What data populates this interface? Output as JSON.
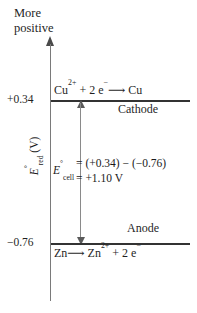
{
  "chart_data": {
    "type": "diagram",
    "ylabel": "E°red (V)",
    "axis_direction_note": "More positive",
    "levels": [
      {
        "name": "cathode",
        "value": 0.34,
        "tick_label": "+0.34",
        "equation": "Cu2+ + 2 e- ⟶ Cu",
        "electrode_label": "Cathode"
      },
      {
        "name": "anode",
        "value": -0.76,
        "tick_label": "−0.76",
        "equation": "Zn ⟶ Zn2+ + 2 e-",
        "electrode_label": "Anode"
      }
    ],
    "cell_potential": {
      "symbol": "E°cell",
      "expression": "= (+0.34) − (−0.76)",
      "result": "= +1.10 V",
      "value": 1.1,
      "unit": "V"
    },
    "ylim": [
      -0.76,
      0.34
    ],
    "grid": false,
    "legend": false
  },
  "axis": {
    "direction_line_1": "More",
    "direction_line_2": "positive",
    "title_symbol": "E",
    "title_superscript": "°",
    "title_subscript": "red",
    "title_unit": "(V)",
    "tick_top": "+0.34",
    "tick_bottom": "−0.76"
  },
  "cathode": {
    "species_left": "Cu",
    "species_left_charge": "2+",
    "plus": "+",
    "electrons": "2 e",
    "electron_charge": "−",
    "arrow": "⟶",
    "species_right": "Cu",
    "electrode_label": "Cathode"
  },
  "anode": {
    "species_left": "Zn",
    "arrow": "⟶",
    "species_right": "Zn",
    "species_right_charge": "2+",
    "plus": "+",
    "electrons": "2 e",
    "electron_charge": "−",
    "electrode_label": "Anode"
  },
  "cell": {
    "symbol_main": "E",
    "symbol_superscript": "°",
    "symbol_subscript": "cell",
    "line_1": "= (+0.34) − (−0.76)",
    "line_2": "= +1.10 V"
  },
  "colors": {
    "background": "#ffffff",
    "text": "#1f1f1f",
    "level_line": "#333333",
    "axis_line": "#7a7a7a",
    "arrow": "#5a5a5a"
  }
}
